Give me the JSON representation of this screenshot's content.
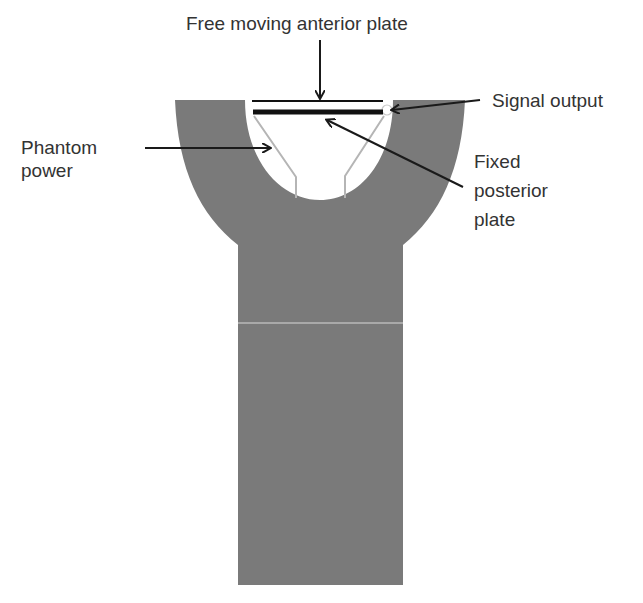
{
  "diagram": {
    "labels": {
      "anterior_plate": "Free moving anterior plate",
      "signal_output": "Signal output",
      "phantom_power_line1": "Phantom",
      "phantom_power_line2": "power",
      "posterior_plate_line1": "Fixed",
      "posterior_plate_line2": "posterior",
      "posterior_plate_line3": "plate"
    },
    "colors": {
      "body": "#7a7a7a",
      "plate": "#111111",
      "wire": "#b5b5b5",
      "text": "#333333",
      "arrow": "#1a1a1a"
    }
  }
}
